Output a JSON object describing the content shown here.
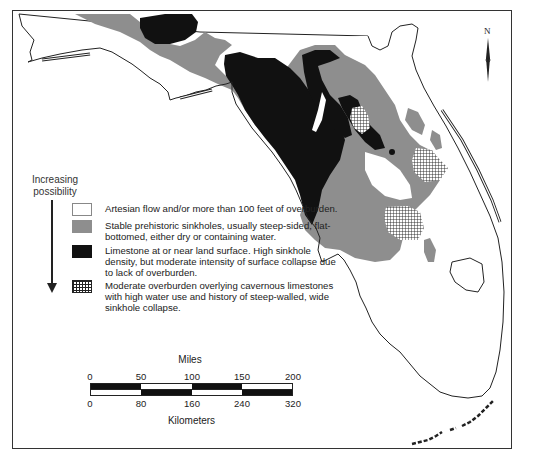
{
  "map": {
    "subject": "Florida sinkhole type regions",
    "colors": {
      "artesian": "#ffffff",
      "stable_prehistoric": "#8e8e8e",
      "limestone_surface": "#111111",
      "moderate_overburden_hatch": "#222222",
      "outline": "#222222"
    },
    "north_arrow": {
      "label": "N"
    }
  },
  "legend": {
    "title_line1": "Increasing",
    "title_line2": "possibility",
    "items": [
      {
        "swatch": "white",
        "text": "Artesian flow and/or more than 100 feet of overburden."
      },
      {
        "swatch": "gray",
        "text": "Stable prehistoric sinkholes, usually steep-sided, flat-bottomed, either dry or containing water."
      },
      {
        "swatch": "black",
        "text": "Limestone at or near land surface.  High sinkhole density, but moderate intensity of surface collapse due to lack of overburden."
      },
      {
        "swatch": "hatch",
        "text": "Moderate overburden overlying cavernous limestones with high water use and history of steep-walled, wide sinkhole collapse."
      }
    ]
  },
  "scale_bar": {
    "miles_label": "Miles",
    "miles_ticks": [
      "0",
      "50",
      "100",
      "150",
      "200"
    ],
    "km_label": "Kilometers",
    "km_ticks": [
      "0",
      "80",
      "160",
      "240",
      "320"
    ]
  }
}
